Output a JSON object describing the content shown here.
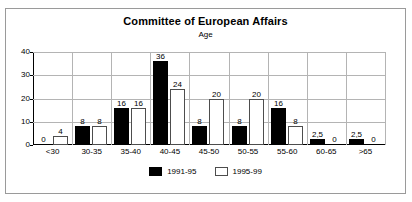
{
  "chart_data": {
    "type": "bar",
    "title": "Committee of European Affairs",
    "subtitle": "Age",
    "xlabel": "",
    "ylabel": "",
    "ylim": [
      0,
      40
    ],
    "yticks": [
      0,
      10,
      20,
      30,
      40
    ],
    "grid": true,
    "legend_position": "bottom",
    "categories": [
      "<30",
      "30-35",
      "35-40",
      "40-45",
      "45-50",
      "50-55",
      "55-60",
      "60-65",
      ">65"
    ],
    "series": [
      {
        "name": "1991-95",
        "color": "#000000",
        "values": [
          0,
          8,
          16,
          36,
          8,
          8,
          16,
          2.5,
          2.5
        ],
        "labels": [
          "0",
          "8",
          "16",
          "36",
          "8",
          "8",
          "16",
          "2,5",
          "2,5"
        ]
      },
      {
        "name": "1995-99",
        "color": "#ffffff",
        "values": [
          4,
          8,
          16,
          24,
          20,
          20,
          8,
          0,
          0
        ],
        "labels": [
          "4",
          "8",
          "16",
          "24",
          "20",
          "20",
          "8",
          "0",
          "0"
        ]
      }
    ]
  },
  "colors": {
    "series_a": "#000000",
    "series_b": "#ffffff",
    "grid": "#b4b4b4",
    "axis": "#000000",
    "frame": "#9a9a9a",
    "background": "#ffffff"
  }
}
